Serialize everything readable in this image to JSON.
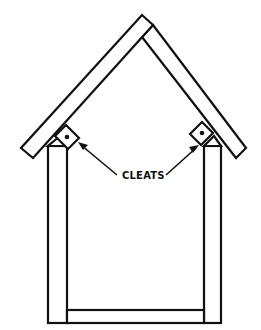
{
  "figure": {
    "label": "CLEATS",
    "colors": {
      "line": "#111111",
      "background": "#ffffff"
    },
    "parts": [
      {
        "name": "left roof board"
      },
      {
        "name": "right roof board"
      },
      {
        "name": "left side post"
      },
      {
        "name": "right side post"
      },
      {
        "name": "bottom board"
      },
      {
        "name": "left cleat"
      },
      {
        "name": "right cleat"
      }
    ]
  }
}
